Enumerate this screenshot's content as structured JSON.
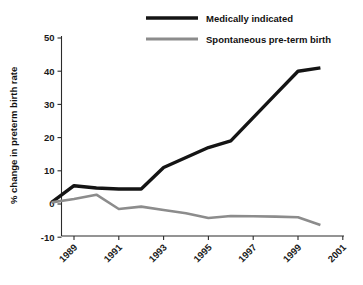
{
  "chart_data": {
    "type": "line",
    "title": "",
    "xlabel": "",
    "ylabel": "% change in preterm birth rate",
    "xlim": [
      1988,
      2001
    ],
    "ylim": [
      -10,
      50
    ],
    "grid": false,
    "legend_position": "top-center",
    "xticks": [
      "1989",
      "1991",
      "1993",
      "1995",
      "1997",
      "1999",
      "2001"
    ],
    "xtick_values": [
      1989,
      1991,
      1993,
      1995,
      1997,
      1999,
      2001
    ],
    "yticks": [
      "50",
      "40",
      "30",
      "20",
      "10",
      "0",
      "-10"
    ],
    "ytick_values": [
      50,
      40,
      30,
      20,
      10,
      0,
      -10
    ],
    "x": [
      1988,
      1989,
      1990,
      1991,
      1992,
      1993,
      1994,
      1995,
      1996,
      1997,
      1998,
      1999,
      2000
    ],
    "series": [
      {
        "name": "Medically indicated",
        "color": "#141414",
        "width": 3.4,
        "values": [
          0.5,
          5.5,
          4.8,
          4.5,
          4.5,
          11.0,
          14.0,
          17.0,
          19.0,
          26.0,
          33.0,
          40.0,
          41.0
        ]
      },
      {
        "name": "Spontaneous pre-term birth",
        "color": "#8c8c8c",
        "width": 2.6,
        "values": [
          0.5,
          1.5,
          2.8,
          -1.5,
          -0.8,
          -1.8,
          -2.8,
          -4.2,
          -3.6,
          -3.7,
          -3.8,
          -4.0,
          -6.3
        ]
      }
    ]
  },
  "legend": {
    "entries": [
      {
        "label": "Medically indicated",
        "color": "#141414"
      },
      {
        "label": "Spontaneous pre-term birth",
        "color": "#8c8c8c"
      }
    ]
  },
  "axes": {
    "y_title": "% change in preterm birth rate"
  }
}
